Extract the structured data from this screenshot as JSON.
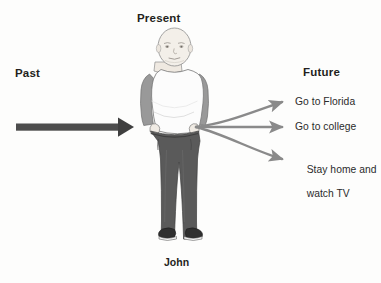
{
  "diagram": {
    "title_past": "Past",
    "title_present": "Present",
    "title_future": "Future",
    "person_caption": "John",
    "future_options": [
      "Go to Florida",
      "Go to college",
      "Stay home and",
      "watch TV"
    ],
    "colors": {
      "text": "#231f20",
      "past_arrow": "#4d4d4d",
      "future_arrow": "#8a8a8a",
      "shirt": "#fcfcfc",
      "sleeve": "#9a9a9a",
      "skin": "#f0ece6",
      "trousers": "#5a5a5a",
      "shoe": "#2f2f2f",
      "background": "#fdfdfc"
    }
  }
}
